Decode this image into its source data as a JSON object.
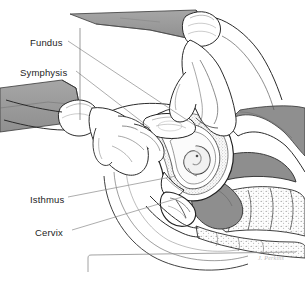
{
  "figure": {
    "type": "medical-line-illustration",
    "width": 305,
    "height": 287,
    "background_color": "#ffffff",
    "ink_color": "#2b2b2b",
    "drape_gray": "#9a9a9a",
    "tissue_gray": "#8e8e8e",
    "stipple_gray": "#b5b5b5",
    "leader_line_color": "#8a8a8a"
  },
  "labels": [
    {
      "id": "fundus",
      "text": "Fundus",
      "x": 30,
      "y": 38,
      "leader_to_x": 196,
      "leader_to_y": 126
    },
    {
      "id": "symphysis",
      "text": "Symphysis",
      "x": 20,
      "y": 68,
      "leader_to_x": 150,
      "leader_to_y": 128
    },
    {
      "id": "isthmus",
      "text": "Isthmus",
      "x": 30,
      "y": 195,
      "leader_to_x": 176,
      "leader_to_y": 176
    },
    {
      "id": "cervix",
      "text": "Cervix",
      "x": 35,
      "y": 228,
      "leader_to_x": 180,
      "leader_to_y": 196
    }
  ],
  "signature": {
    "text": "J. Perkins",
    "legible": false
  },
  "anatomy": [
    {
      "name": "examining-hand-upper",
      "description": "abdominal hand pressing down from upper right with sleeve cuff"
    },
    {
      "name": "examining-hand-lower",
      "description": "vaginal examining hand entering from left with sleeve cuff"
    },
    {
      "name": "drape-sheet-upper",
      "description": "gray draped sheet across top"
    },
    {
      "name": "drape-sheet-left",
      "description": "gray draped sheet at mid left"
    },
    {
      "name": "uterus-gravid",
      "description": "sagittal section of gravid uterus with fundus, isthmus and cervix"
    },
    {
      "name": "embryo",
      "description": "coiled embryo within uterine cavity"
    },
    {
      "name": "bladder",
      "description": "bladder anterior to uterus"
    },
    {
      "name": "symphysis-pubis",
      "description": "pubic symphysis bone"
    },
    {
      "name": "sacrum-vertebrae",
      "description": "stippled sacrum and vertebral bodies lower right"
    },
    {
      "name": "rectum",
      "description": "rectum posterior to uterus"
    },
    {
      "name": "frame-corner-rule",
      "description": "thin L-shaped rule at lower border"
    }
  ]
}
